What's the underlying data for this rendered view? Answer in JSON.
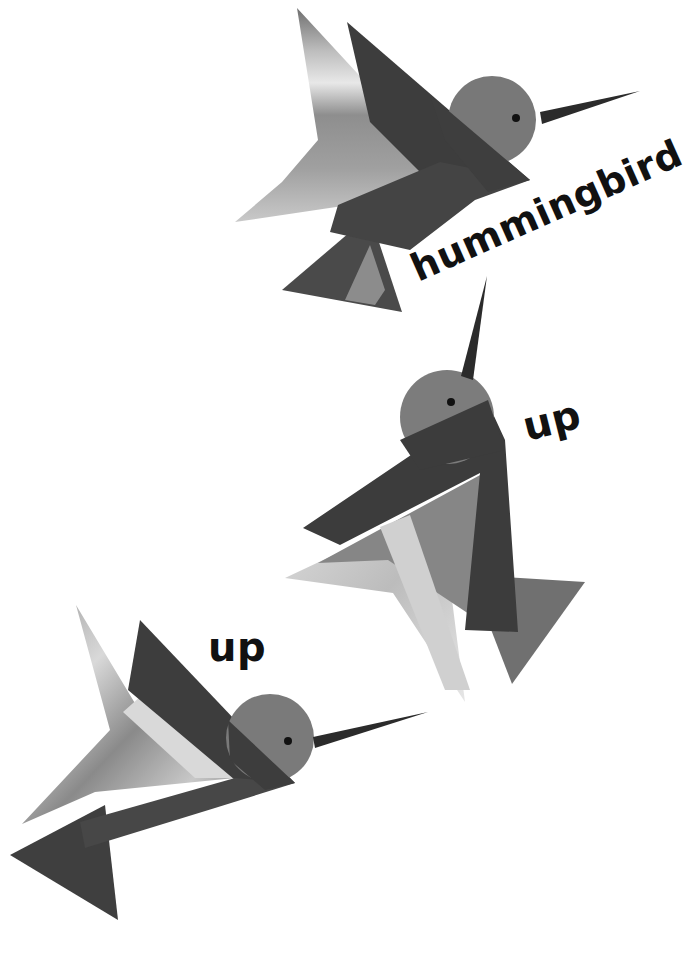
{
  "page": {
    "background": "#ffffff",
    "labels": {
      "top": "hummingbird",
      "middle": "up",
      "bottom": "up"
    }
  },
  "illustrations": [
    {
      "name": "hummingbird-top",
      "pose": "flying right, beak pointing right-up"
    },
    {
      "name": "hummingbird-middle",
      "pose": "flying upward, beak pointing up"
    },
    {
      "name": "hummingbird-bottom",
      "pose": "flying right, beak pointing right-up"
    }
  ],
  "colors": {
    "dark": "#3a3a3a",
    "mid": "#6e6e6e",
    "light": "#b5b5b5",
    "pale": "#d8d8d8",
    "head": "#7b7b7b",
    "beak": "#2b2b2b",
    "eye": "#111111",
    "text": "#111111"
  }
}
